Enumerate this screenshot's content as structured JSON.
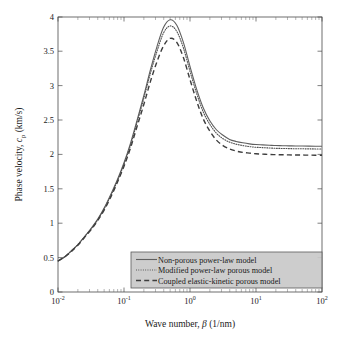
{
  "chart_data": {
    "type": "line",
    "title": "",
    "xlabel": "Wave number, β (1/nm)",
    "ylabel": "Phase velocity, c_p (km/s)",
    "xscale": "log",
    "yscale": "linear",
    "xlim": [
      0.01,
      100
    ],
    "ylim": [
      0,
      4
    ],
    "grid": false,
    "legend_position": "lower-right",
    "xtick_labels": [
      "10-2",
      "10-1",
      "100",
      "101",
      "102"
    ],
    "xtick_mantissa": [
      "10",
      "10",
      "10",
      "10",
      "10"
    ],
    "xtick_exponents": [
      "-2",
      "-1",
      "0",
      "1",
      "2"
    ],
    "xtick_values": [
      0.01,
      0.1,
      1,
      10,
      100
    ],
    "ytick_labels": [
      "0",
      "0.5",
      "1",
      "1.5",
      "2",
      "2.5",
      "3",
      "3.5",
      "4"
    ],
    "ytick_values": [
      0,
      0.5,
      1,
      1.5,
      2,
      2.5,
      3,
      3.5,
      4
    ],
    "x": [
      0.01,
      0.013,
      0.016,
      0.02,
      0.025,
      0.032,
      0.04,
      0.05,
      0.063,
      0.079,
      0.1,
      0.126,
      0.158,
      0.2,
      0.251,
      0.316,
      0.398,
      0.501,
      0.631,
      0.794,
      1.0,
      1.259,
      1.585,
      1.995,
      2.512,
      3.162,
      3.981,
      5.012,
      6.31,
      7.943,
      10.0,
      12.59,
      15.85,
      19.95,
      25.12,
      31.62,
      39.81,
      50.12,
      63.1,
      79.43,
      100.0
    ],
    "series": [
      {
        "name": "Non-porous power-law model",
        "style": "solid",
        "color": "#5f5f5f",
        "peak_x": 0.35,
        "peak_y": 3.97,
        "plateau_y": 2.12,
        "values": [
          0.45,
          0.52,
          0.6,
          0.69,
          0.8,
          0.93,
          1.06,
          1.22,
          1.42,
          1.63,
          1.88,
          2.17,
          2.5,
          2.86,
          3.23,
          3.57,
          3.85,
          3.96,
          3.88,
          3.63,
          3.28,
          2.95,
          2.68,
          2.49,
          2.36,
          2.28,
          2.22,
          2.19,
          2.17,
          2.155,
          2.145,
          2.14,
          2.135,
          2.13,
          2.128,
          2.126,
          2.124,
          2.123,
          2.122,
          2.121,
          2.12
        ]
      },
      {
        "name": "Modified power-law porous model",
        "style": "dotted",
        "color": "#4f4f4f",
        "peak_x": 0.35,
        "peak_y": 3.88,
        "plateau_y": 2.08,
        "values": [
          0.45,
          0.52,
          0.6,
          0.69,
          0.8,
          0.92,
          1.05,
          1.21,
          1.4,
          1.61,
          1.86,
          2.14,
          2.47,
          2.82,
          3.18,
          3.5,
          3.77,
          3.87,
          3.79,
          3.55,
          3.21,
          2.89,
          2.62,
          2.44,
          2.31,
          2.23,
          2.18,
          2.15,
          2.13,
          2.115,
          2.105,
          2.1,
          2.095,
          2.09,
          2.088,
          2.086,
          2.084,
          2.083,
          2.082,
          2.081,
          2.08
        ]
      },
      {
        "name": "Coupled elastic-kinetic porous model",
        "style": "dashed",
        "color": "#3d3d3d",
        "peak_x": 0.35,
        "peak_y": 3.7,
        "plateau_y": 1.99,
        "values": [
          0.45,
          0.52,
          0.59,
          0.68,
          0.79,
          0.91,
          1.04,
          1.19,
          1.38,
          1.59,
          1.83,
          2.1,
          2.41,
          2.73,
          3.06,
          3.35,
          3.58,
          3.69,
          3.63,
          3.41,
          3.09,
          2.78,
          2.52,
          2.34,
          2.21,
          2.13,
          2.08,
          2.05,
          2.03,
          2.02,
          2.01,
          2.005,
          2.0,
          1.998,
          1.996,
          1.994,
          1.993,
          1.992,
          1.991,
          1.99,
          1.99
        ]
      }
    ],
    "legend": [
      "Non-porous power-law model",
      "Modified power-law porous model",
      "Coupled elastic-kinetic porous model"
    ]
  },
  "axis": {
    "ylabel_prefix": "Phase velocity, ",
    "ylabel_symbol": "c",
    "ylabel_subscript": "p",
    "ylabel_suffix": " (km/s)",
    "xlabel_prefix": "Wave number, ",
    "xlabel_symbol": "β",
    "xlabel_suffix": " (1/nm)"
  }
}
